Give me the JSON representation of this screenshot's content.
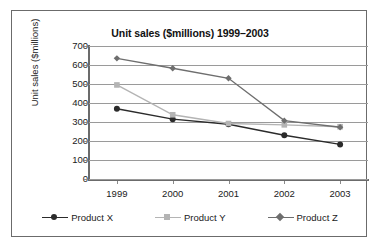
{
  "chart_data": {
    "type": "line",
    "title": "Unit sales ($millions) 1999–2003",
    "xlabel": "",
    "ylabel": "Unit sales ($millions)",
    "categories": [
      "1999",
      "2000",
      "2001",
      "2002",
      "2003"
    ],
    "ylim": [
      0,
      700
    ],
    "yticks": [
      "0",
      "100",
      "200",
      "300",
      "400",
      "500",
      "600",
      "700"
    ],
    "grid": true,
    "legend_position": "bottom",
    "series": [
      {
        "name": "Product X",
        "values": [
          370,
          315,
          288,
          230,
          182
        ],
        "color": "#2b2b2b",
        "marker": "circle"
      },
      {
        "name": "Product Y",
        "values": [
          495,
          338,
          292,
          285,
          275
        ],
        "color": "#b4b4b4",
        "marker": "square"
      },
      {
        "name": "Product Z",
        "values": [
          635,
          583,
          530,
          307,
          272
        ],
        "color": "#6e6e6e",
        "marker": "diamond"
      }
    ]
  },
  "frame": {
    "border_color": "#6b6b6b",
    "background": "#ffffff",
    "gridline_color": "#9a9a9a"
  }
}
